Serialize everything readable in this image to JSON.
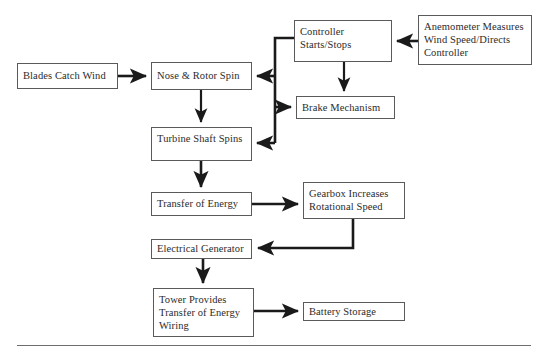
{
  "diagram": {
    "type": "flowchart",
    "line_color": "#1a1a1a",
    "box_border_color": "#5a5a5a",
    "background": "#ffffff",
    "nodes": [
      {
        "id": "blades",
        "label": "Blades Catch Wind",
        "x": 17,
        "y": 63,
        "w": 101,
        "h": 26
      },
      {
        "id": "nose",
        "label": "Nose & Rotor Spin",
        "x": 151,
        "y": 62,
        "w": 101,
        "h": 28
      },
      {
        "id": "controller",
        "label": "Controller\nStarts/Stops",
        "x": 294,
        "y": 20,
        "w": 98,
        "h": 42
      },
      {
        "id": "anemometer",
        "label": "Anemometer Measures\nWind Speed/Directs\nController",
        "x": 418,
        "y": 15,
        "w": 114,
        "h": 50
      },
      {
        "id": "brake",
        "label": "Brake Mechanism",
        "x": 296,
        "y": 96,
        "w": 99,
        "h": 23
      },
      {
        "id": "shaft",
        "label": "Turbine Shaft Spins",
        "x": 151,
        "y": 127,
        "w": 101,
        "h": 34
      },
      {
        "id": "transfer",
        "label": "Transfer of Energy",
        "x": 151,
        "y": 192,
        "w": 101,
        "h": 24
      },
      {
        "id": "gearbox",
        "label": "Gearbox Increases\nRotational Speed",
        "x": 303,
        "y": 182,
        "w": 102,
        "h": 37
      },
      {
        "id": "generator",
        "label": "Electrical Generator",
        "x": 151,
        "y": 239,
        "w": 101,
        "h": 20
      },
      {
        "id": "tower",
        "label": "Tower Provides\nTransfer of Energy\nWiring",
        "x": 153,
        "y": 288,
        "w": 101,
        "h": 49
      },
      {
        "id": "battery",
        "label": "Battery Storage",
        "x": 303,
        "y": 302,
        "w": 102,
        "h": 19
      }
    ],
    "edges": [
      {
        "id": "blades-to-nose",
        "from": "blades",
        "to": "nose"
      },
      {
        "id": "anemometer-to-controller",
        "from": "anemometer",
        "to": "controller"
      },
      {
        "id": "controller-to-nose",
        "from": "controller",
        "to": "nose"
      },
      {
        "id": "controller-to-brake",
        "from": "controller",
        "to": "brake"
      },
      {
        "id": "trunk-to-brake",
        "from": "controller",
        "to": "brake"
      },
      {
        "id": "trunk-to-shaft",
        "from": "controller",
        "to": "shaft"
      },
      {
        "id": "nose-to-shaft",
        "from": "nose",
        "to": "shaft"
      },
      {
        "id": "shaft-to-transfer",
        "from": "shaft",
        "to": "transfer"
      },
      {
        "id": "transfer-to-gearbox",
        "from": "transfer",
        "to": "gearbox"
      },
      {
        "id": "gearbox-to-generator",
        "from": "gearbox",
        "to": "generator"
      },
      {
        "id": "generator-to-tower",
        "from": "generator",
        "to": "tower"
      },
      {
        "id": "tower-to-battery",
        "from": "tower",
        "to": "battery"
      }
    ],
    "footer_rule": true
  }
}
